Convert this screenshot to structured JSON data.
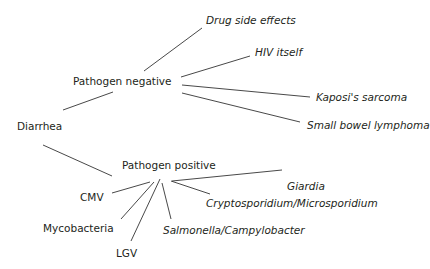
{
  "diagram": {
    "root": "Diarrhea",
    "branches": [
      {
        "label": "Pathogen negative",
        "children": [
          "Drug side effects",
          "HIV itself",
          "Kaposi's sarcoma",
          "Small bowel lymphoma"
        ]
      },
      {
        "label": "Pathogen positive",
        "children": [
          "Giardia",
          "Cryptosporidium/Microsporidium",
          "Salmonella/Campylobacter",
          "LGV",
          "Mycobacteria",
          "CMV"
        ]
      }
    ]
  }
}
